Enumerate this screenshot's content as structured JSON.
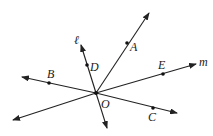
{
  "diagram": {
    "type": "geometry",
    "center": {
      "label": "O",
      "x": 96,
      "y": 93
    },
    "lines": [
      {
        "name": "m",
        "label": "m",
        "from": [
          13,
          120
        ],
        "to": [
          196,
          64
        ],
        "arrows": "both"
      },
      {
        "name": "BC",
        "label": "",
        "from": [
          22,
          77
        ],
        "to": [
          177,
          113
        ],
        "arrows": "both"
      },
      {
        "name": "l",
        "label": "ℓ",
        "from": [
          81,
          45
        ],
        "to": [
          107,
          128
        ],
        "arrows": "both"
      },
      {
        "name": "OA",
        "label": "",
        "from": [
          96,
          93
        ],
        "to": [
          149,
          13
        ],
        "arrows": "end"
      }
    ],
    "points": [
      {
        "label": "A",
        "x": 127,
        "y": 43
      },
      {
        "label": "B",
        "x": 49,
        "y": 83
      },
      {
        "label": "C",
        "x": 153,
        "y": 108
      },
      {
        "label": "D",
        "x": 87,
        "y": 65
      },
      {
        "label": "E",
        "x": 163,
        "y": 74
      },
      {
        "label": "O",
        "x": 96,
        "y": 93
      }
    ],
    "labels": {
      "A": "A",
      "B": "B",
      "C": "C",
      "D": "D",
      "E": "E",
      "O": "O",
      "l": "ℓ",
      "m": "m"
    }
  }
}
